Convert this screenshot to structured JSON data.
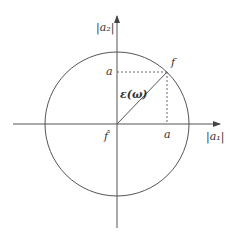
{
  "diagram": {
    "axes": {
      "x_label": "|a₁|",
      "y_label": "|a₂|"
    },
    "labels": {
      "point_f": "f",
      "point_f_hat": "f̂",
      "epsilon": "ε(ω)",
      "a_vertical": "a",
      "a_horizontal": "a"
    },
    "colors": {
      "stroke": "#555555",
      "text": "#333333"
    }
  }
}
